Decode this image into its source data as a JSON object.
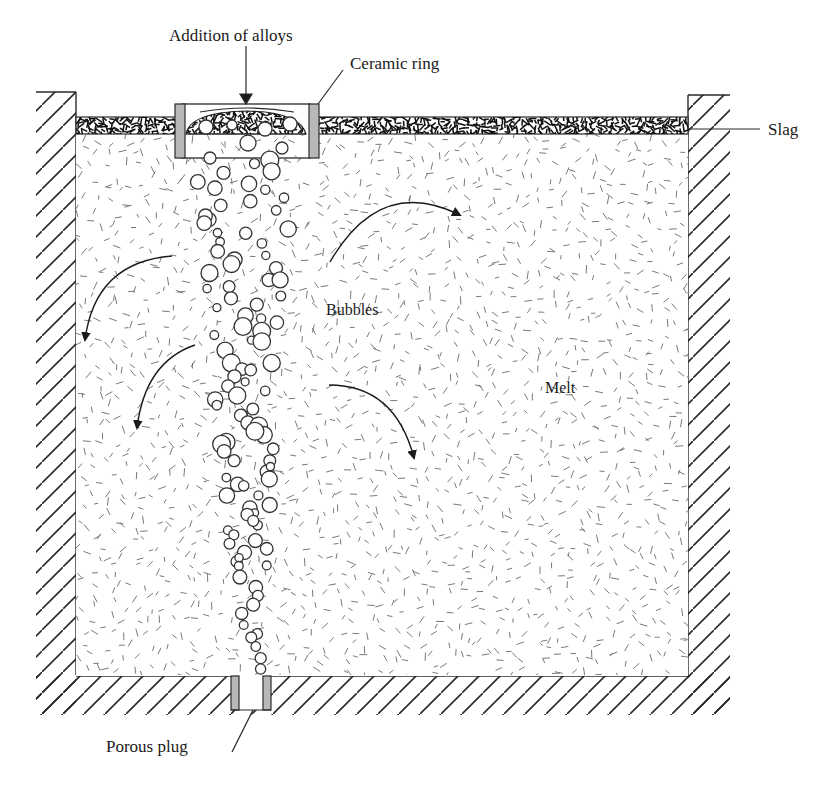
{
  "diagram": {
    "type": "ladle-gas-stirring-schematic",
    "colors": {
      "line": "#2a2a2a",
      "ring_fill": "#b8b8b8",
      "texture": "#6a6a6a",
      "background": "#ffffff"
    },
    "labels": {
      "addition": "Addition of alloys",
      "ceramic_ring": "Ceramic ring",
      "slag": "Slag",
      "bubbles": "Bubbles",
      "melt": "Melt",
      "porous_plug": "Porous plug"
    },
    "flow_arrows": [
      {
        "name": "upper-right-circulation",
        "direction": "clockwise-down-right"
      },
      {
        "name": "upper-left-circulation",
        "direction": "down-left"
      },
      {
        "name": "middle-left-circulation",
        "direction": "down-left"
      },
      {
        "name": "middle-right-circulation",
        "direction": "down-right"
      }
    ]
  }
}
